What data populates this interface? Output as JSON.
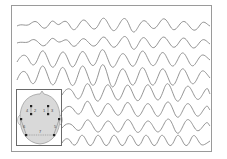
{
  "figure": {
    "trace_count": 8,
    "trace_color": "#7a7a7a",
    "frame_color": "#9a9a9a"
  },
  "inset": {
    "head_fill": "#d9d9d9",
    "electrode_color": "#222222",
    "labels": [
      "4",
      "2",
      "1",
      "3",
      "6",
      "5",
      "7"
    ]
  }
}
